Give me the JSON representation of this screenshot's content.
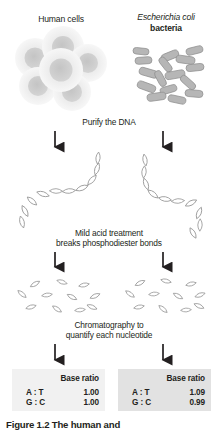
{
  "figure": {
    "columns": {
      "left": {
        "title": "Human cells",
        "organism_type": "human-cells"
      },
      "right": {
        "title_species": "Escherichia coli",
        "title_kind": "bacteria",
        "organism_type": "ecoli-bacteria"
      }
    },
    "steps": [
      {
        "id": "purify",
        "text": "Purify the DNA"
      },
      {
        "id": "acid",
        "line1": "Mild acid treatment",
        "line2": "breaks phosphodiester bonds"
      },
      {
        "id": "chromatography",
        "line1": "Chromatography to",
        "line2": "quantify each nucleotide"
      }
    ],
    "results": {
      "header": "Base ratio",
      "left": {
        "rows": [
          {
            "pair": "A : T",
            "value": "1.00"
          },
          {
            "pair": "G : C",
            "value": "1.00"
          }
        ]
      },
      "right": {
        "rows": [
          {
            "pair": "A : T",
            "value": "1.09"
          },
          {
            "pair": "G : C",
            "value": "0.99"
          }
        ]
      }
    },
    "caption": "Figure  1.2   The human and ",
    "colors": {
      "text": "#231f20",
      "box_left_bg": "#f1f1f1",
      "box_right_bg": "#e2e2e2",
      "cell_fill": "#e9e9e9",
      "nucleus_fill": "#c9c9c9",
      "bacteria_fill": "#b9b9b9",
      "stroke": "#8a8a8a",
      "arrow": "#231f20"
    }
  }
}
